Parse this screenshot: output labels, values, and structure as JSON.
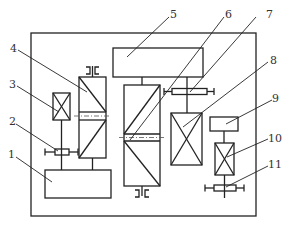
{
  "diagram": {
    "type": "mechanical transmission schematic",
    "labels": {
      "l1": "1",
      "l2": "2",
      "l3": "3",
      "l4": "4",
      "l5": "5",
      "l6": "6",
      "l7": "7",
      "l8": "8",
      "l9": "9",
      "l10": "10",
      "l11": "11"
    },
    "colors": {
      "line": "#222222",
      "background": "#ffffff",
      "centerline": "#555555"
    }
  }
}
